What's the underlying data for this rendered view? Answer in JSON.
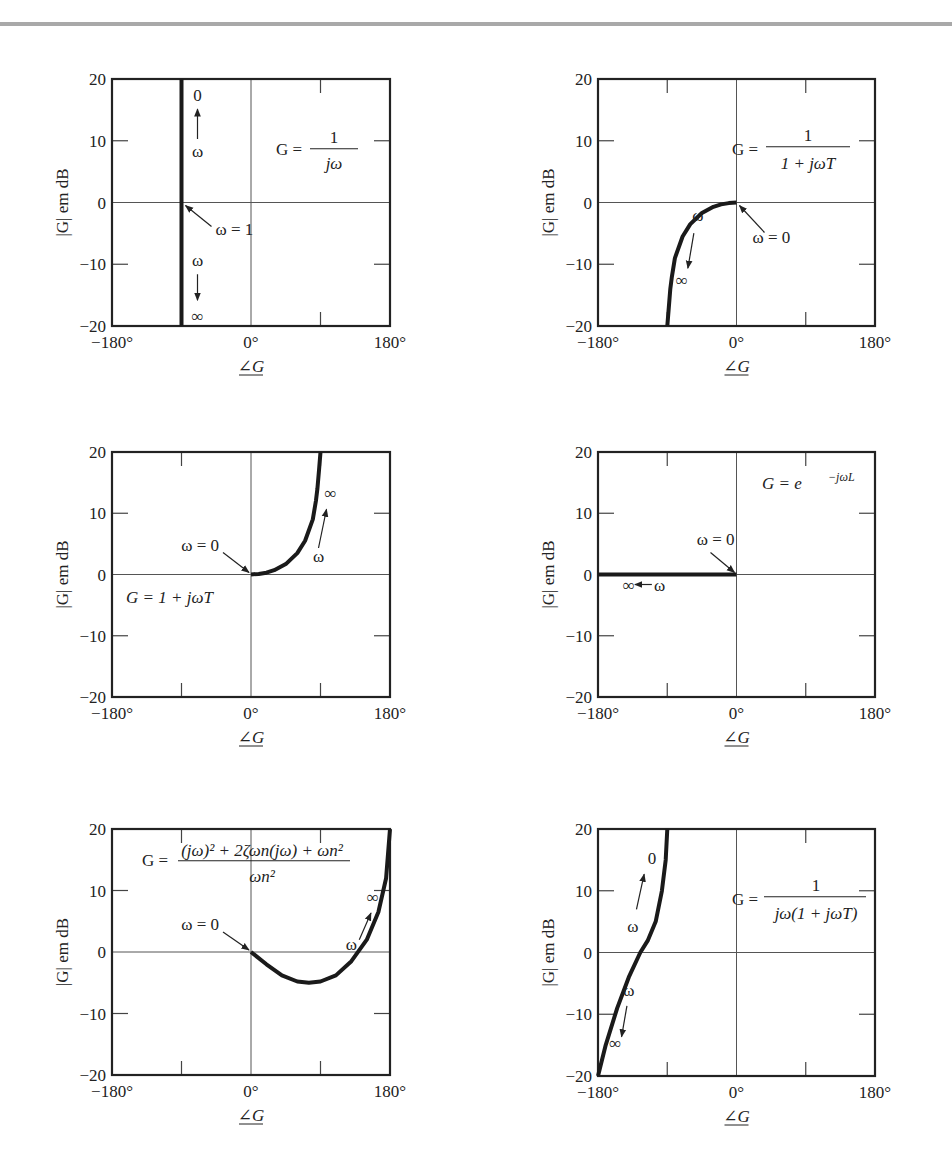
{
  "page": {
    "clipped_header_text": "",
    "top_rule_color": "#a9a9a9"
  },
  "axes_common": {
    "ylabel": "|G| em dB",
    "xlabel": "∠G",
    "yticks": [
      "20",
      "10",
      "0",
      "−10",
      "−20"
    ],
    "xticks": [
      "−180°",
      "0°",
      "180°"
    ],
    "xlim": [
      -180,
      180
    ],
    "ylim": [
      -20,
      20
    ]
  },
  "chart_data": [
    {
      "type": "line",
      "title": "G = 1/(jω)",
      "formula_lhs": "G =",
      "formula_num": "1",
      "formula_den": "jω",
      "xlabel": "∠G",
      "ylabel": "|G| em dB",
      "xlim": [
        -180,
        180
      ],
      "ylim": [
        -20,
        20
      ],
      "grid": "axes at 0",
      "series": [
        {
          "name": "G = 1/jω",
          "x": [
            -90,
            -90
          ],
          "y": [
            20,
            -20
          ]
        }
      ],
      "annotations": [
        {
          "text": "0",
          "note": "top end, ω→0"
        },
        {
          "text": "ω",
          "note": "arrow up toward 0"
        },
        {
          "text": "ω = 1",
          "note": "point (-90°, 0 dB)"
        },
        {
          "text": "ω",
          "note": "arrow down toward ∞"
        },
        {
          "text": "∞",
          "note": "bottom end"
        }
      ]
    },
    {
      "type": "line",
      "title": "G = 1/(1 + jωT)",
      "formula_lhs": "G =",
      "formula_num": "1",
      "formula_den": "1 + jωT",
      "xlabel": "∠G",
      "ylabel": "|G| em dB",
      "xlim": [
        -180,
        180
      ],
      "ylim": [
        -20,
        20
      ],
      "series": [
        {
          "name": "G = 1/(1+jωT)",
          "x": [
            0,
            -10,
            -20,
            -30,
            -45,
            -60,
            -70,
            -80,
            -84,
            -86,
            -88,
            -90
          ],
          "y": [
            0,
            -0.1,
            -0.3,
            -0.7,
            -1.7,
            -3.5,
            -5.5,
            -9,
            -12,
            -14,
            -17,
            -20
          ]
        }
      ],
      "annotations": [
        {
          "text": "ω = 0",
          "note": "point (0°, 0 dB)"
        },
        {
          "text": "ω",
          "note": "arrow down toward ∞"
        },
        {
          "text": "∞",
          "note": "lower end"
        }
      ]
    },
    {
      "type": "line",
      "title": "G = 1 + jωT",
      "formula": "G = 1 + jωT",
      "xlabel": "∠G",
      "ylabel": "|G| em dB",
      "xlim": [
        -180,
        180
      ],
      "ylim": [
        -20,
        20
      ],
      "series": [
        {
          "name": "G = 1+jωT",
          "x": [
            0,
            10,
            20,
            30,
            45,
            60,
            70,
            80,
            84,
            86,
            88,
            90
          ],
          "y": [
            0,
            0.1,
            0.3,
            0.7,
            1.7,
            3.5,
            5.5,
            9,
            12,
            14,
            17,
            20
          ]
        }
      ],
      "annotations": [
        {
          "text": "ω = 0",
          "note": "point (0°, 0 dB)"
        },
        {
          "text": "ω",
          "note": "arrow up toward ∞"
        },
        {
          "text": "∞",
          "note": "upper end"
        }
      ]
    },
    {
      "type": "line",
      "title": "G = e^(−jωL)",
      "formula_base": "G = e",
      "formula_exp": "−jωL",
      "xlabel": "∠G",
      "ylabel": "|G| em dB",
      "xlim": [
        -180,
        180
      ],
      "ylim": [
        -20,
        20
      ],
      "series": [
        {
          "name": "G = e^(−jωL)",
          "x": [
            0,
            -180
          ],
          "y": [
            0,
            0
          ]
        }
      ],
      "annotations": [
        {
          "text": "ω = 0",
          "note": "point (0°, 0 dB)"
        },
        {
          "text": "ω",
          "note": "arrow left toward ∞"
        },
        {
          "text": "∞",
          "note": "left end"
        }
      ]
    },
    {
      "type": "line",
      "title": "G = ((jω)² + 2ζωn(jω) + ωn²)/ωn²",
      "formula_lhs": "G =",
      "formula_num": "(jω)² + 2ζωn(jω) + ωn²",
      "formula_den": "ωn²",
      "xlabel": "∠G",
      "ylabel": "|G| em dB",
      "xlim": [
        -180,
        180
      ],
      "ylim": [
        -20,
        20
      ],
      "series": [
        {
          "name": "second-order numerator",
          "x": [
            0,
            20,
            40,
            60,
            75,
            90,
            110,
            130,
            150,
            165,
            175,
            180
          ],
          "y": [
            0,
            -2,
            -3.8,
            -4.8,
            -5,
            -4.8,
            -3.8,
            -1.5,
            2,
            6.5,
            12,
            20
          ]
        }
      ],
      "annotations": [
        {
          "text": "ω = 0",
          "note": "point (0°, 0 dB)"
        },
        {
          "text": "ω",
          "note": "arrow up-right toward ∞"
        },
        {
          "text": "∞",
          "note": "upper right end"
        }
      ]
    },
    {
      "type": "line",
      "title": "G = 1/(jω(1 + jωT))",
      "formula_lhs": "G =",
      "formula_num": "1",
      "formula_den": "jω(1 + jωT)",
      "xlabel": "∠G",
      "ylabel": "|G| em dB",
      "xlim": [
        -180,
        180
      ],
      "ylim": [
        -20,
        20
      ],
      "series": [
        {
          "name": "G = 1/(jω(1+jωT))",
          "x": [
            -90,
            -92,
            -97,
            -105,
            -115,
            -125,
            -140,
            -155,
            -170,
            -180
          ],
          "y": [
            20,
            15,
            10,
            5,
            2,
            0,
            -4,
            -9,
            -15,
            -20
          ]
        }
      ],
      "annotations": [
        {
          "text": "0",
          "note": "upper end, ω→0"
        },
        {
          "text": "ω",
          "note": "arrow up toward 0"
        },
        {
          "text": "ω",
          "note": "arrow down toward ∞"
        },
        {
          "text": "∞",
          "note": "lower end"
        }
      ]
    }
  ],
  "panels": [
    {
      "id": "p1",
      "labels": {
        "a_top": "0",
        "a_w1": "ω",
        "a_eq": "ω = 1",
        "a_w2": "ω",
        "a_inf": "∞"
      }
    },
    {
      "id": "p2",
      "labels": {
        "a_eq": "ω = 0",
        "a_w": "ω",
        "a_inf": "∞"
      }
    },
    {
      "id": "p3",
      "labels": {
        "a_eq": "ω = 0",
        "a_w": "ω",
        "a_inf": "∞"
      }
    },
    {
      "id": "p4",
      "labels": {
        "a_eq": "ω = 0",
        "a_w": "ω",
        "a_inf": "∞"
      }
    },
    {
      "id": "p5",
      "labels": {
        "a_eq": "ω = 0",
        "a_w": "ω",
        "a_inf": "∞"
      }
    },
    {
      "id": "p6",
      "labels": {
        "a_top": "0",
        "a_w1": "ω",
        "a_w2": "ω",
        "a_inf": "∞"
      }
    }
  ]
}
